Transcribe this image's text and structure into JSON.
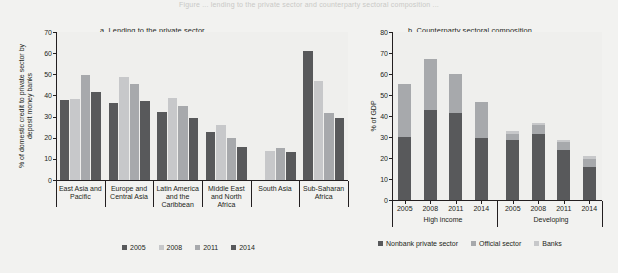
{
  "topcrop_text": "Figure ... lending to the private sector and counterparty sectoral composition ...",
  "colors": {
    "background": "#f2f2f0",
    "plot_background": "#efefed",
    "axis": "#231f20",
    "year_2005": "#58595b",
    "year_2008": "#c7c8ca",
    "year_2011": "#a7a9ac",
    "year_2014": "#58595b",
    "nonbank_private_sector": "#58595b",
    "official_sector": "#a7a9ac",
    "banks": "#c7c8ca"
  },
  "panel_a": {
    "title": "a. Lending to the private sector",
    "ylabel": "% of domestic credit to private sector by deposit money banks",
    "legend": [
      {
        "label": "2005",
        "color": "#58595b"
      },
      {
        "label": "2008",
        "color": "#c7c8ca"
      },
      {
        "label": "2011",
        "color": "#a7a9ac"
      },
      {
        "label": "2014",
        "color": "#58595b"
      }
    ]
  },
  "panel_b": {
    "title": "b. Counterparty sectoral composition",
    "ylabel": "% of GDP",
    "group_labels": [
      "High income",
      "Developing"
    ],
    "legend": [
      {
        "label": "Nonbank private sector",
        "color": "#58595b"
      },
      {
        "label": "Official sector",
        "color": "#a7a9ac"
      },
      {
        "label": "Banks",
        "color": "#c7c8ca"
      }
    ]
  },
  "chart_data": [
    {
      "type": "bar",
      "title": "a. Lending to the private sector",
      "xlabel": "",
      "ylabel": "% of domestic credit to private sector by deposit money banks",
      "ylim": [
        0,
        70
      ],
      "yticks": [
        0,
        10,
        20,
        30,
        40,
        50,
        60,
        70
      ],
      "grid": false,
      "legend_position": "bottom",
      "categories": [
        "East Asia and Pacific",
        "Europe and Central Asia",
        "Latin America and the Caribbean",
        "Middle East and North Africa",
        "South Asia",
        "Sub-Saharan Africa"
      ],
      "series": [
        {
          "name": "2005",
          "color": "#58595b",
          "values": [
            37.8,
            36.3,
            32.2,
            22.5,
            0.0,
            61.2
          ]
        },
        {
          "name": "2008",
          "color": "#c7c8ca",
          "values": [
            38.2,
            48.8,
            38.8,
            26.0,
            13.8,
            46.8
          ]
        },
        {
          "name": "2011",
          "color": "#a7a9ac",
          "values": [
            49.7,
            45.5,
            34.8,
            20.0,
            15.0,
            31.5
          ]
        },
        {
          "name": "2014",
          "color": "#58595b",
          "values": [
            41.4,
            37.2,
            29.5,
            15.5,
            13.3,
            29.3
          ]
        }
      ]
    },
    {
      "type": "bar",
      "title": "b. Counterparty sectoral composition",
      "xlabel": "",
      "ylabel": "% of GDP",
      "ylim": [
        0,
        80
      ],
      "yticks": [
        0,
        10,
        20,
        30,
        40,
        50,
        60,
        70,
        80
      ],
      "grid": false,
      "stacked": true,
      "legend_position": "bottom",
      "groups": [
        {
          "name": "High income",
          "categories": [
            "2005",
            "2008",
            "2011",
            "2014"
          ]
        },
        {
          "name": "Developing",
          "categories": [
            "2005",
            "2008",
            "2011",
            "2014"
          ]
        }
      ],
      "categories": [
        "2005",
        "2008",
        "2011",
        "2014",
        "2005",
        "2008",
        "2011",
        "2014"
      ],
      "series": [
        {
          "name": "Nonbank private sector",
          "color": "#58595b",
          "values": [
            29.8,
            42.8,
            41.4,
            29.4,
            28.4,
            31.6,
            23.8,
            15.6
          ]
        },
        {
          "name": "Official sector",
          "color": "#a7a9ac",
          "values": [
            25.4,
            24.4,
            18.6,
            17.2,
            3.2,
            4.2,
            3.6,
            4.0
          ]
        },
        {
          "name": "Banks",
          "color": "#c7c8ca",
          "values": [
            0.0,
            0.0,
            0.0,
            0.0,
            1.2,
            0.9,
            1.0,
            1.3
          ]
        }
      ],
      "totals": [
        55.2,
        67.2,
        60.0,
        46.6,
        32.8,
        36.7,
        28.4,
        20.9
      ]
    }
  ]
}
